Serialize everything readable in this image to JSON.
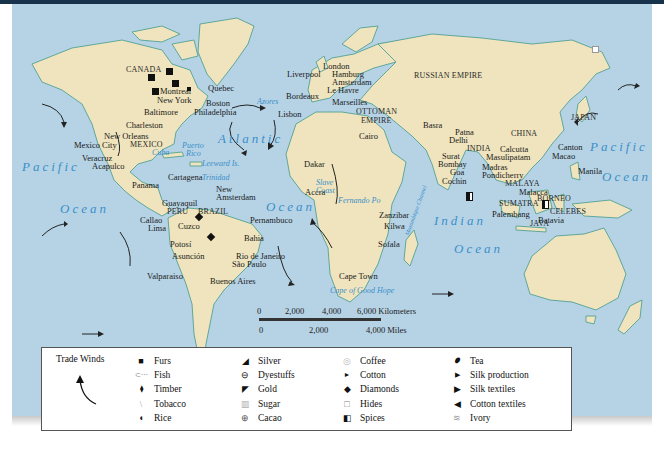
{
  "map": {
    "regions": {
      "canada": "CANADA",
      "mexico": "MEXICO",
      "peru": "PERU",
      "brazil": "BRAZIL",
      "russian_empire": "RUSSIAN EMPIRE",
      "ottoman_empire_1": "OTTOMAN",
      "ottoman_empire_2": "EMPIRE",
      "india": "INDIA",
      "china": "CHINA",
      "japan": "JAPAN",
      "malaya": "MALAYA",
      "sumatra": "SUMATRA",
      "borneo": "BORNEO",
      "celebes": "CELEBES",
      "java": "JAVA"
    },
    "oceans": {
      "pacific_west": "Pacific",
      "ocean_west_1": "Ocean",
      "ocean_west_2": "Ocean",
      "atlantic": "Atlantic",
      "ocean_atlantic": "Ocean",
      "indian": "Indian",
      "ocean_indian": "Ocean",
      "pacific_east": "Pacific",
      "ocean_east": "Ocean"
    },
    "seas": {
      "azores": "Azores",
      "cuba": "Cuba",
      "puerto_rico_1": "Puerto",
      "puerto_rico_2": "Rico",
      "leeward": "Leeward Is.",
      "trinidad": "Trinidad",
      "slave_coast_1": "Slave",
      "slave_coast_2": "Coast",
      "fernando_po": "Fernando Po",
      "mozambique_channel": "Mozambique Channel",
      "cape_good_hope": "Cape of Good Hope"
    },
    "cities": {
      "montreal": "Montreal",
      "quebec": "Quebec",
      "new_york": "New York",
      "boston": "Boston",
      "baltimore": "Baltimore",
      "philadelphia": "Philadelphia",
      "charleston": "Charleston",
      "new_orleans": "New Orleans",
      "mexico_city": "Mexico City",
      "veracruz": "Veracruz",
      "acapulco": "Acapulco",
      "panama": "Panama",
      "cartagena": "Cartagena",
      "new_amsterdam_1": "New",
      "new_amsterdam_2": "Amsterdam",
      "guayaquil": "Guayaquil",
      "callao": "Callao",
      "lima": "Lima",
      "cuzco": "Cuzco",
      "potosi": "Potosí",
      "asuncion": "Asunción",
      "pernambuco": "Pernambuco",
      "bahia": "Bahia",
      "rio": "Rio de Janeiro",
      "sao_paulo": "São Paulo",
      "buenos_aires": "Buenos Aires",
      "valparaiso": "Valparaiso",
      "liverpool": "Liverpool",
      "london": "London",
      "hamburg": "Hamburg",
      "amsterdam": "Amsterdam",
      "le_havre": "Le Havre",
      "bordeaux": "Bordeaux",
      "marseilles": "Marseilles",
      "lisbon": "Lisbon",
      "cairo": "Cairo",
      "basra": "Basra",
      "dakar": "Dakar",
      "accra": "Accra",
      "zanzibar": "Zanzibar",
      "kilwa": "Kilwa",
      "sofala": "Sofala",
      "cape_town": "Cape Town",
      "patna": "Patna",
      "delhi": "Delhi",
      "calcutta": "Calcutta",
      "surat": "Surat",
      "masulipatam": "Masulipatam",
      "bombay": "Bombay",
      "goa": "Goa",
      "madras": "Madras",
      "pondicherry": "Pondicherry",
      "cochin": "Cochin",
      "canton": "Canton",
      "macao": "Macao",
      "manila": "Manila",
      "malacca": "Malacca",
      "palembang": "Palembang",
      "batavia": "Batavia"
    },
    "colors": {
      "ocean": "#b6d3e6",
      "land": "#efe4bd",
      "coast": "#5fa79a",
      "ocean_label": "#3a8fc8",
      "header_bar": "#17324a"
    }
  },
  "scale_bar": {
    "km_ticks": [
      "0",
      "2,000",
      "4,000",
      "6,000 Kilometers"
    ],
    "mile_ticks": [
      "0",
      "2,000",
      "4,000 Miles"
    ]
  },
  "legend": {
    "title": "Trade Winds",
    "columns": [
      [
        {
          "icon": "furs-square-icon",
          "glyph": "■",
          "label": "Furs"
        },
        {
          "icon": "fish-icon",
          "glyph": "⊂⋯",
          "label": "Fish"
        },
        {
          "icon": "timber-icon",
          "glyph": "⧫",
          "label": "Timber"
        },
        {
          "icon": "tobacco-icon",
          "glyph": "\\",
          "label": "Tobacco"
        },
        {
          "icon": "rice-icon",
          "glyph": "◖",
          "label": "Rice"
        }
      ],
      [
        {
          "icon": "silver-icon",
          "glyph": "◢",
          "label": "Silver"
        },
        {
          "icon": "dyestuffs-icon",
          "glyph": "⊖",
          "label": "Dyestuffs"
        },
        {
          "icon": "gold-icon",
          "glyph": "◤",
          "label": "Gold"
        },
        {
          "icon": "sugar-icon",
          "glyph": "▥",
          "label": "Sugar"
        },
        {
          "icon": "cacao-icon",
          "glyph": "⊕",
          "label": "Cacao"
        }
      ],
      [
        {
          "icon": "coffee-icon",
          "glyph": "◎",
          "label": "Coffee"
        },
        {
          "icon": "cotton-icon",
          "glyph": "►",
          "label": "Cotton"
        },
        {
          "icon": "diamonds-icon",
          "glyph": "◆",
          "label": "Diamonds"
        },
        {
          "icon": "hides-icon",
          "glyph": "□",
          "label": "Hides"
        },
        {
          "icon": "spices-icon",
          "glyph": "◧",
          "label": "Spices"
        }
      ],
      [
        {
          "icon": "tea-icon",
          "glyph": "⬮",
          "label": "Tea"
        },
        {
          "icon": "silk-production-icon",
          "glyph": "▶",
          "label": "Silk production"
        },
        {
          "icon": "silk-textiles-icon",
          "glyph": "▶",
          "label": "Silk textiles"
        },
        {
          "icon": "cotton-textiles-icon",
          "glyph": "◀",
          "label": "Cotton textiles"
        },
        {
          "icon": "ivory-icon",
          "glyph": "≋",
          "label": "Ivory"
        }
      ]
    ]
  }
}
